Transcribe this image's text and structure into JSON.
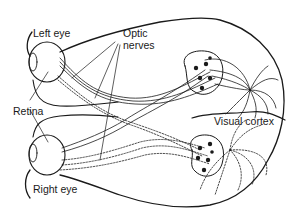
{
  "diagram": {
    "type": "anatomical-diagram",
    "labels": {
      "left_eye": "Left eye",
      "optic_nerves_line1": "Optic",
      "optic_nerves_line2": "nerves",
      "retina": "Retina",
      "visual_cortex": "Visual cortex",
      "right_eye": "Right eye"
    },
    "colors": {
      "stroke": "#1a1a1a",
      "background": "#ffffff"
    }
  }
}
